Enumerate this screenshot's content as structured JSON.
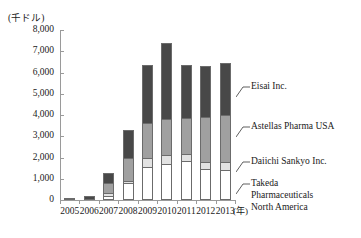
{
  "chart_data": {
    "type": "bar",
    "subtype": "stacked-vertical",
    "title": "",
    "subtitle": "",
    "xlabel": "年",
    "ylabel": "(千ドル)",
    "y_unit_caption": "(千ドル)",
    "categories": [
      "2005",
      "2006",
      "2007",
      "2008",
      "2009",
      "2010",
      "2011",
      "2012",
      "2013"
    ],
    "ylim": [
      0,
      8000
    ],
    "ytick_step": 1000,
    "ytick_labels": [
      "8,000",
      "7,000",
      "6,000",
      "5,000",
      "4,000",
      "3,000",
      "2,000",
      "1,000",
      "0"
    ],
    "ytick_values": [
      8000,
      7000,
      6000,
      5000,
      4000,
      3000,
      2000,
      1000,
      0
    ],
    "grid": false,
    "legend_position": "right-callout",
    "series": [
      {
        "name": "Takeda Pharmaceuticals North America",
        "color": "#ffffff",
        "values": [
          20,
          20,
          180,
          800,
          1560,
          1700,
          1820,
          1440,
          1400
        ]
      },
      {
        "name": "Daiichi Sankyo Inc.",
        "color": "#e2e2e2",
        "values": [
          10,
          10,
          150,
          100,
          400,
          400,
          350,
          350,
          400
        ]
      },
      {
        "name": "Astellas Pharma USA",
        "color": "#a0a0a0",
        "values": [
          20,
          30,
          450,
          1100,
          1680,
          1700,
          1700,
          2100,
          2200
        ]
      },
      {
        "name": "Eisai Inc.",
        "color": "#484848",
        "values": [
          30,
          120,
          480,
          1300,
          2700,
          3600,
          2470,
          2400,
          2450
        ]
      }
    ],
    "totals": [
      80,
      180,
      1260,
      3300,
      6340,
      7400,
      6340,
      6290,
      6450
    ]
  },
  "legend": {
    "eisai": "Eisai Inc.",
    "astellas": "Astellas Pharma USA",
    "daiichi": "Daiichi Sankyo Inc.",
    "takeda_line1": "Takeda",
    "takeda_line2": "Pharmaceuticals",
    "takeda_line3": "North America"
  },
  "axis": {
    "y_unit": "(千ドル)",
    "x_unit": "(年)",
    "y_labels": [
      "8,000",
      "7,000",
      "6,000",
      "5,000",
      "4,000",
      "3,000",
      "2,000",
      "1,000",
      "0"
    ],
    "x_labels": [
      "2005",
      "2006",
      "2007",
      "2008",
      "2009",
      "2010",
      "2011",
      "2012",
      "2013"
    ]
  },
  "colors": {
    "takeda": "#ffffff",
    "daiichi": "#e2e2e2",
    "astellas": "#a0a0a0",
    "eisai": "#484848",
    "axis": "#9a9a9a",
    "outline": "#6b6b6b",
    "text": "#1a1a1a"
  }
}
